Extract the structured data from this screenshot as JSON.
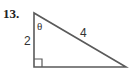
{
  "problem": {
    "number_label": "13."
  },
  "triangle": {
    "type": "right-triangle",
    "angle_label": "θ",
    "vertical_leg_label": "2",
    "hypotenuse_label": "4",
    "right_angle_marker": true,
    "stroke_color": "#555555",
    "vertices": {
      "top": [
        34,
        13
      ],
      "right_angle": [
        34,
        67
      ],
      "right": [
        126,
        67
      ]
    }
  }
}
